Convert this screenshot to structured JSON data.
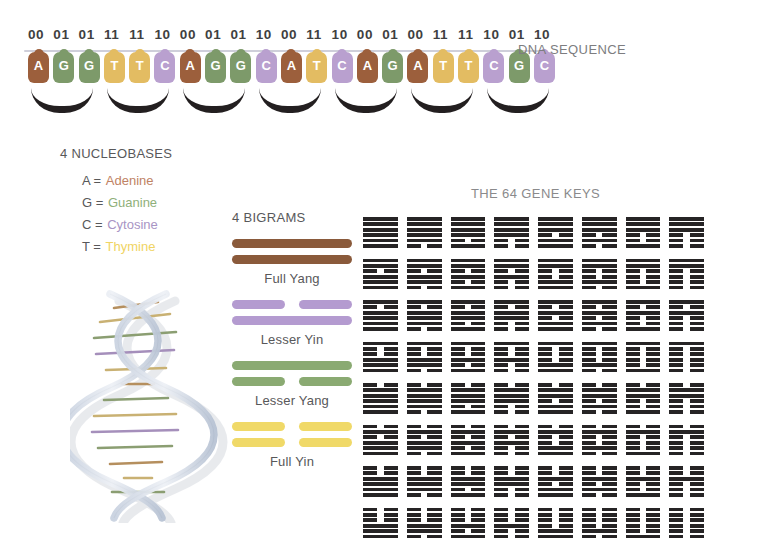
{
  "dna_sequence": {
    "label": "DNA SEQUENCE",
    "binary_pairs": [
      "00",
      "01",
      "01",
      "11",
      "11",
      "10",
      "00",
      "01",
      "01",
      "10",
      "00",
      "11",
      "10",
      "00",
      "01",
      "00",
      "11",
      "11",
      "10",
      "01",
      "10"
    ],
    "bases": [
      "A",
      "G",
      "G",
      "T",
      "T",
      "C",
      "A",
      "G",
      "G",
      "C",
      "A",
      "T",
      "C",
      "A",
      "G",
      "A",
      "T",
      "T",
      "C",
      "G",
      "C"
    ],
    "codon_count": 7
  },
  "nucleobases": {
    "heading": "4 NUCLEOBASES",
    "items": [
      {
        "code": "A",
        "eq": "=",
        "name": "Adenine",
        "color": "#c08264"
      },
      {
        "code": "G",
        "eq": "=",
        "name": "Guanine",
        "color": "#8fb07a"
      },
      {
        "code": "C",
        "eq": "=",
        "name": "Cytosine",
        "color": "#a894c4"
      },
      {
        "code": "T",
        "eq": "=",
        "name": "Thymine",
        "color": "#f0d463"
      }
    ]
  },
  "helix": {
    "name": "dna-double-helix-illustration",
    "signature": ""
  },
  "bigrams": {
    "heading": "4 BIGRAMS",
    "items": [
      {
        "label": "Full Yang",
        "color": "#8a5a3b",
        "class": "c-yang",
        "lines": [
          "solid",
          "solid"
        ]
      },
      {
        "label": "Lesser Yin",
        "color": "#b49bd0",
        "class": "c-lyin",
        "lines": [
          "broken",
          "solid"
        ]
      },
      {
        "label": "Lesser Yang",
        "color": "#8aaa72",
        "class": "c-lyang",
        "lines": [
          "solid",
          "broken"
        ]
      },
      {
        "label": "Full Yin",
        "color": "#f0d968",
        "class": "c-yin",
        "lines": [
          "broken",
          "broken"
        ]
      }
    ]
  },
  "gene_keys": {
    "title": "THE  64 GENE KEYS",
    "count": 64,
    "columns": 8,
    "rows": 8,
    "line_color": "#262425",
    "hexagrams": [
      [
        1,
        1,
        1,
        1,
        1,
        1
      ],
      [
        0,
        1,
        1,
        1,
        1,
        1
      ],
      [
        1,
        0,
        1,
        1,
        1,
        1
      ],
      [
        0,
        0,
        1,
        1,
        1,
        1
      ],
      [
        1,
        1,
        0,
        1,
        1,
        1
      ],
      [
        0,
        1,
        0,
        1,
        1,
        1
      ],
      [
        1,
        0,
        0,
        1,
        1,
        1
      ],
      [
        0,
        0,
        0,
        1,
        1,
        1
      ],
      [
        1,
        1,
        1,
        0,
        1,
        1
      ],
      [
        0,
        1,
        1,
        0,
        1,
        1
      ],
      [
        1,
        0,
        1,
        0,
        1,
        1
      ],
      [
        0,
        0,
        1,
        0,
        1,
        1
      ],
      [
        1,
        1,
        0,
        0,
        1,
        1
      ],
      [
        0,
        1,
        0,
        0,
        1,
        1
      ],
      [
        1,
        0,
        0,
        0,
        1,
        1
      ],
      [
        0,
        0,
        0,
        0,
        1,
        1
      ],
      [
        1,
        1,
        1,
        1,
        0,
        1
      ],
      [
        0,
        1,
        1,
        1,
        0,
        1
      ],
      [
        1,
        0,
        1,
        1,
        0,
        1
      ],
      [
        0,
        0,
        1,
        1,
        0,
        1
      ],
      [
        1,
        1,
        0,
        1,
        0,
        1
      ],
      [
        0,
        1,
        0,
        1,
        0,
        1
      ],
      [
        1,
        0,
        0,
        1,
        0,
        1
      ],
      [
        0,
        0,
        0,
        1,
        0,
        1
      ],
      [
        1,
        1,
        1,
        0,
        0,
        1
      ],
      [
        0,
        1,
        1,
        0,
        0,
        1
      ],
      [
        1,
        0,
        1,
        0,
        0,
        1
      ],
      [
        0,
        0,
        1,
        0,
        0,
        1
      ],
      [
        1,
        1,
        0,
        0,
        0,
        1
      ],
      [
        0,
        1,
        0,
        0,
        0,
        1
      ],
      [
        1,
        0,
        0,
        0,
        0,
        1
      ],
      [
        0,
        0,
        0,
        0,
        0,
        1
      ],
      [
        1,
        1,
        1,
        1,
        1,
        0
      ],
      [
        0,
        1,
        1,
        1,
        1,
        0
      ],
      [
        1,
        0,
        1,
        1,
        1,
        0
      ],
      [
        0,
        0,
        1,
        1,
        1,
        0
      ],
      [
        1,
        1,
        0,
        1,
        1,
        0
      ],
      [
        0,
        1,
        0,
        1,
        1,
        0
      ],
      [
        1,
        0,
        0,
        1,
        1,
        0
      ],
      [
        0,
        0,
        0,
        1,
        1,
        0
      ],
      [
        1,
        1,
        1,
        0,
        1,
        0
      ],
      [
        0,
        1,
        1,
        0,
        1,
        0
      ],
      [
        1,
        0,
        1,
        0,
        1,
        0
      ],
      [
        0,
        0,
        1,
        0,
        1,
        0
      ],
      [
        1,
        1,
        0,
        0,
        1,
        0
      ],
      [
        0,
        1,
        0,
        0,
        1,
        0
      ],
      [
        1,
        0,
        0,
        0,
        1,
        0
      ],
      [
        0,
        0,
        0,
        0,
        1,
        0
      ],
      [
        1,
        1,
        1,
        1,
        0,
        0
      ],
      [
        0,
        1,
        1,
        1,
        0,
        0
      ],
      [
        1,
        0,
        1,
        1,
        0,
        0
      ],
      [
        0,
        0,
        1,
        1,
        0,
        0
      ],
      [
        1,
        1,
        0,
        1,
        0,
        0
      ],
      [
        0,
        1,
        0,
        1,
        0,
        0
      ],
      [
        1,
        0,
        0,
        1,
        0,
        0
      ],
      [
        0,
        0,
        0,
        1,
        0,
        0
      ],
      [
        1,
        1,
        1,
        0,
        0,
        0
      ],
      [
        0,
        1,
        1,
        0,
        0,
        0
      ],
      [
        1,
        0,
        1,
        0,
        0,
        0
      ],
      [
        0,
        0,
        1,
        0,
        0,
        0
      ],
      [
        1,
        1,
        0,
        0,
        0,
        0
      ],
      [
        0,
        1,
        0,
        0,
        0,
        0
      ],
      [
        1,
        0,
        0,
        0,
        0,
        0
      ],
      [
        0,
        0,
        0,
        0,
        0,
        0
      ]
    ]
  },
  "palette": {
    "adenine_tile": "#9c5f3c",
    "guanine_tile": "#7d9a6a",
    "cytosine_tile": "#b9a0cf",
    "thymine_tile": "#e3bc62",
    "ink": "#231f20",
    "label_grey": "#7d7d80",
    "background": "#ffffff"
  }
}
